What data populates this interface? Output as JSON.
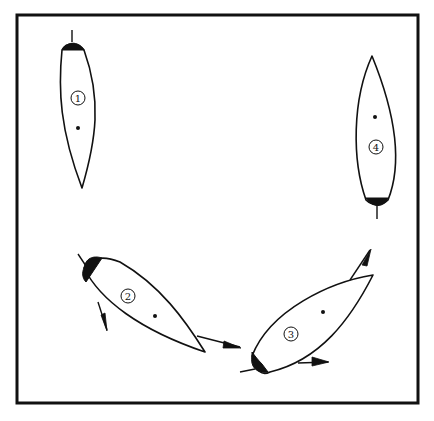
{
  "diagram": {
    "boats": [
      {
        "id": "boat-1",
        "label": "1",
        "heading": "down",
        "arrows": 0
      },
      {
        "id": "boat-2",
        "label": "2",
        "heading": "down-right",
        "arrows": 2
      },
      {
        "id": "boat-3",
        "label": "3",
        "heading": "up-right",
        "arrows": 2
      },
      {
        "id": "boat-4",
        "label": "4",
        "heading": "up",
        "arrows": 0
      }
    ],
    "colors": {
      "ink": "#111111",
      "background": "#ffffff"
    }
  }
}
